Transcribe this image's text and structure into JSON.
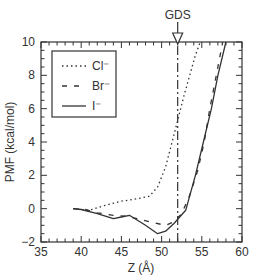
{
  "chart_data": {
    "type": "line",
    "title": "",
    "xlabel": "Z (Å)",
    "ylabel": "PMF (kcal/mol)",
    "xlim": [
      35,
      60
    ],
    "ylim": [
      -2,
      10
    ],
    "xticks": [
      35,
      40,
      45,
      50,
      55,
      60
    ],
    "yticks": [
      -2,
      0,
      2,
      4,
      6,
      8,
      10
    ],
    "grid": false,
    "legend_position": "upper left",
    "annotations": [
      {
        "text": "GDS",
        "type": "vertical-line-arrow",
        "x": 52
      }
    ],
    "series": [
      {
        "name": "Cl⁻",
        "style": "dotted",
        "x": [
          39.0,
          41.0,
          43.0,
          45.0,
          47.0,
          48.5,
          49.5,
          50.5,
          51.3,
          52.0,
          52.8,
          53.5,
          54.2,
          54.8
        ],
        "values": [
          0.0,
          -0.1,
          0.2,
          0.45,
          0.6,
          0.75,
          1.3,
          2.5,
          4.0,
          5.3,
          6.8,
          8.0,
          9.2,
          10.0
        ]
      },
      {
        "name": "Br⁻",
        "style": "dashed",
        "x": [
          39.0,
          40.5,
          42.0,
          44.0,
          45.5,
          47.0,
          49.0,
          50.5,
          51.5,
          52.5,
          53.5,
          54.5,
          55.3,
          56.0,
          56.8,
          57.6
        ],
        "values": [
          0.0,
          -0.05,
          -0.25,
          -0.4,
          -0.45,
          -0.6,
          -0.85,
          -1.0,
          -0.8,
          -0.3,
          0.8,
          2.3,
          4.0,
          6.0,
          8.0,
          10.0
        ]
      },
      {
        "name": "I⁻",
        "style": "solid",
        "x": [
          39.0,
          40.0,
          42.0,
          44.0,
          45.0,
          46.0,
          48.0,
          49.5,
          50.5,
          51.5,
          53.0,
          54.2,
          55.2,
          56.2,
          57.0,
          58.0
        ],
        "values": [
          0.0,
          -0.05,
          -0.3,
          -0.6,
          -0.5,
          -0.4,
          -1.0,
          -1.5,
          -1.35,
          -0.9,
          -0.1,
          2.0,
          4.0,
          6.0,
          8.0,
          10.0
        ]
      }
    ]
  },
  "labels": {
    "xlabel": "Z (Å)",
    "ylabel": "PMF (kcal/mol)",
    "annotation": "GDS",
    "legend": [
      "Cl⁻",
      "Br⁻",
      "I⁻"
    ],
    "xticks": [
      "35",
      "40",
      "45",
      "50",
      "55",
      "60"
    ],
    "yticks": [
      "−2",
      "0",
      "2",
      "4",
      "6",
      "8",
      "10"
    ]
  },
  "colors": {
    "line": "#333333",
    "axis": "#333333",
    "background": "#ffffff"
  }
}
